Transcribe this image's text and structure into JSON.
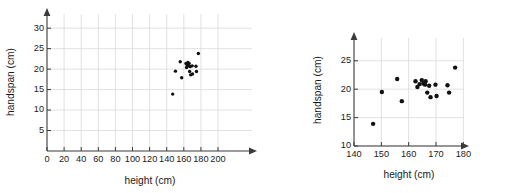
{
  "figure": {
    "type": "scatter-pair",
    "background": "#ffffff",
    "point_color": "#111111",
    "axis_color": "#3a3a3a",
    "grid_color": "#d9d9d9"
  },
  "chart_data": [
    {
      "type": "scatter",
      "id": "left",
      "title": "",
      "xlabel": "height (cm)",
      "ylabel": "handspan (cm)",
      "xlim": [
        0,
        205
      ],
      "ylim": [
        0,
        34
      ],
      "xticks": [
        0,
        20,
        40,
        60,
        80,
        100,
        120,
        140,
        160,
        180,
        200
      ],
      "yticks": [
        5,
        10,
        15,
        20,
        25,
        30
      ],
      "grid": true,
      "legend": "none",
      "x": [
        147.0,
        150.2,
        155.8,
        157.5,
        162.5,
        163.2,
        164.0,
        164.8,
        165.4,
        166.0,
        166.2,
        166.8,
        167.5,
        168.0,
        169.8,
        170.2,
        174.2,
        174.8,
        177.0
      ],
      "y": [
        13.9,
        19.5,
        21.8,
        17.9,
        21.4,
        20.4,
        20.9,
        21.6,
        21.0,
        20.8,
        21.4,
        19.4,
        20.6,
        18.6,
        20.8,
        18.8,
        20.7,
        19.4,
        23.8
      ]
    },
    {
      "type": "scatter",
      "id": "right",
      "title": "",
      "xlabel": "height (cm)",
      "ylabel": "handspan (cm)",
      "xlim": [
        140,
        185
      ],
      "ylim": [
        10,
        27.2
      ],
      "xticks": [
        140,
        150,
        160,
        170,
        180
      ],
      "yticks": [
        10,
        15,
        20,
        25
      ],
      "grid": true,
      "legend": "none",
      "x": [
        147.0,
        150.2,
        155.8,
        157.5,
        162.5,
        163.2,
        164.0,
        164.8,
        165.4,
        166.0,
        166.2,
        166.8,
        167.5,
        168.0,
        169.8,
        170.2,
        174.2,
        174.8,
        177.0
      ],
      "y": [
        13.9,
        19.5,
        21.8,
        17.9,
        21.4,
        20.4,
        20.9,
        21.6,
        21.0,
        20.8,
        21.4,
        19.4,
        20.6,
        18.6,
        20.8,
        18.8,
        20.7,
        19.4,
        23.8
      ]
    }
  ],
  "panels": {
    "left": {
      "xlabel": "height (cm)",
      "ylabel": "handspan (cm)",
      "xtick_labels": [
        "0",
        "20",
        "40",
        "60",
        "80",
        "100",
        "120",
        "140",
        "160",
        "180",
        "200"
      ],
      "ytick_labels": [
        "5",
        "10",
        "15",
        "20",
        "25",
        "30"
      ]
    },
    "right": {
      "xlabel": "height (cm)",
      "ylabel": "handspan (cm)",
      "xtick_labels": [
        "140",
        "150",
        "160",
        "170",
        "180"
      ],
      "ytick_labels": [
        "10",
        "15",
        "20",
        "25"
      ]
    }
  }
}
